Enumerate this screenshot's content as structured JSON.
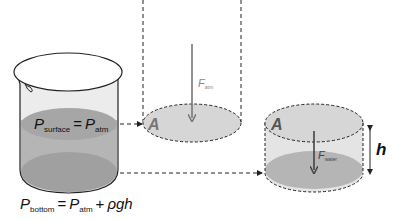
{
  "beaker": {
    "surface_label": {
      "main": "P",
      "sub": "surface",
      "eq": "=",
      "rhs_main": "P",
      "rhs_sub": "atm"
    },
    "bottom_label": {
      "main": "P",
      "sub": "bottom",
      "eq": "=",
      "rhs_main": "P",
      "rhs_sub": "atm",
      "plus": "+",
      "term": "ρgh"
    }
  },
  "atm_column": {
    "area_label": "A",
    "force_label": {
      "main": "F",
      "sub": "atm"
    }
  },
  "water_cylinder": {
    "area_label": "A",
    "force_label": {
      "main": "F",
      "sub": "water"
    },
    "height_label": "h"
  },
  "colors": {
    "water_dark": "#9a9a9a",
    "water_light": "#c8c8c8",
    "disk_fill": "#d6d6d6",
    "outline": "#222222",
    "arrow": "#777777",
    "arrow_dark": "#444444",
    "label_gray": "#7a7a7a"
  }
}
